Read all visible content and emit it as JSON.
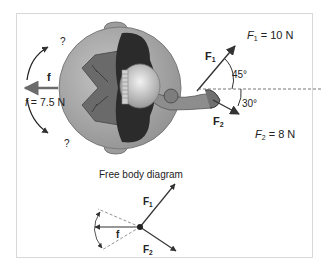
{
  "figure": {
    "top_labels": {
      "friction_symbol": "f",
      "friction_value_symbol": "f",
      "friction_value": " = 7.5  N",
      "question_top": "?",
      "question_bottom": "?",
      "f1_symbol": "F",
      "f1_sub": "1",
      "f1_value_symbol": "F",
      "f1_value_sub": "1",
      "f1_value": " = 10  N",
      "f2_symbol": "F",
      "f2_sub": "2",
      "f2_value_symbol": "F",
      "f2_value_sub": "2",
      "f2_value": " = 8  N",
      "angle1": "45°",
      "angle2": "30°"
    },
    "fbd": {
      "title": "Free body diagram",
      "f1_symbol": "F",
      "f1_sub": "1",
      "f2_symbol": "F",
      "f2_sub": "2",
      "friction_symbol": "f"
    },
    "forces": [
      {
        "name": "F1",
        "magnitude": 10,
        "unit": "N",
        "angle_deg": 45,
        "direction": "above horizontal"
      },
      {
        "name": "F2",
        "magnitude": 8,
        "unit": "N",
        "angle_deg": 30,
        "direction": "below horizontal"
      },
      {
        "name": "f",
        "magnitude": 7.5,
        "unit": "N",
        "direction": "left"
      }
    ],
    "colors": {
      "ball": "#a9a9a9",
      "ball_edge": "#7a7a7a",
      "body_dark": "#2b2b2b",
      "arms": "#6f6f6f",
      "arrow": "#333333",
      "friction_arrow": "#6b6b6b"
    }
  }
}
